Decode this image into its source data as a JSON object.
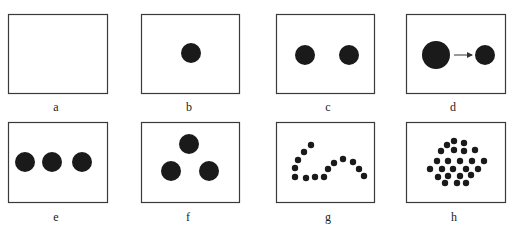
{
  "figure": {
    "stroke_color": "#3a3a3a",
    "dot_color": "#1a1a1a",
    "panels": [
      {
        "label": "a",
        "box": [
          8,
          14,
          99,
          79
        ],
        "label_pos": [
          56,
          100
        ],
        "dots": []
      },
      {
        "label": "b",
        "box": [
          141,
          14,
          98,
          79
        ],
        "label_pos": [
          189,
          100
        ],
        "dots": [
          [
            191,
            53,
            10
          ]
        ]
      },
      {
        "label": "c",
        "box": [
          276,
          14,
          98,
          79
        ],
        "label_pos": [
          328,
          100
        ],
        "dots": [
          [
            305,
            55,
            10
          ],
          [
            349,
            55,
            10
          ]
        ]
      },
      {
        "label": "d",
        "box": [
          406,
          14,
          99,
          79
        ],
        "label_pos": [
          453,
          100
        ],
        "dots": [
          [
            436,
            55,
            14
          ],
          [
            485,
            55,
            10
          ]
        ],
        "arrow": {
          "from": [
            454,
            55
          ],
          "to": [
            472,
            55
          ]
        }
      },
      {
        "label": "e",
        "box": [
          8,
          122,
          99,
          80
        ],
        "label_pos": [
          56,
          210
        ],
        "dots": [
          [
            25,
            162,
            10
          ],
          [
            52,
            162,
            10
          ],
          [
            82,
            162,
            10
          ]
        ]
      },
      {
        "label": "f",
        "box": [
          141,
          122,
          98,
          80
        ],
        "label_pos": [
          188,
          210
        ],
        "dots": [
          [
            189,
            144,
            10
          ],
          [
            171,
            171,
            10
          ],
          [
            209,
            171,
            10
          ]
        ]
      },
      {
        "label": "g",
        "box": [
          276,
          122,
          98,
          80
        ],
        "label_pos": [
          328,
          210
        ],
        "dots": [
          [
            295,
            168,
            3.2
          ],
          [
            298,
            160,
            3.2
          ],
          [
            304,
            152,
            3.2
          ],
          [
            311,
            145,
            3.2
          ],
          [
            295,
            177,
            3.2
          ],
          [
            306,
            178,
            3.2
          ],
          [
            315,
            177,
            3.2
          ],
          [
            324,
            177,
            3.2
          ],
          [
            328,
            169,
            3.2
          ],
          [
            334,
            163,
            3.2
          ],
          [
            343,
            159,
            3.2
          ],
          [
            353,
            162,
            3.2
          ],
          [
            359,
            169,
            3.2
          ],
          [
            364,
            176,
            3.2
          ]
        ]
      },
      {
        "label": "h",
        "box": [
          406,
          122,
          99,
          80
        ],
        "label_pos": [
          454,
          210
        ],
        "dots": [
          [
            454,
            141,
            3.2
          ],
          [
            464,
            143,
            3.2
          ],
          [
            447,
            145,
            3.2
          ],
          [
            441,
            151,
            3.2
          ],
          [
            454,
            150,
            3.2
          ],
          [
            464,
            151,
            3.2
          ],
          [
            475,
            150,
            3.2
          ],
          [
            437,
            161,
            3.2
          ],
          [
            448,
            161,
            3.2
          ],
          [
            460,
            161,
            3.2
          ],
          [
            472,
            161,
            3.2
          ],
          [
            484,
            161,
            3.2
          ],
          [
            430,
            169,
            3.2
          ],
          [
            442,
            169,
            3.2
          ],
          [
            453,
            169,
            3.2
          ],
          [
            466,
            169,
            3.2
          ],
          [
            478,
            169,
            3.2
          ],
          [
            438,
            177,
            3.2
          ],
          [
            448,
            176,
            3.2
          ],
          [
            460,
            176,
            3.2
          ],
          [
            471,
            175,
            3.2
          ],
          [
            445,
            183,
            3.2
          ],
          [
            457,
            183,
            3.2
          ],
          [
            466,
            183,
            3.2
          ]
        ]
      }
    ]
  }
}
